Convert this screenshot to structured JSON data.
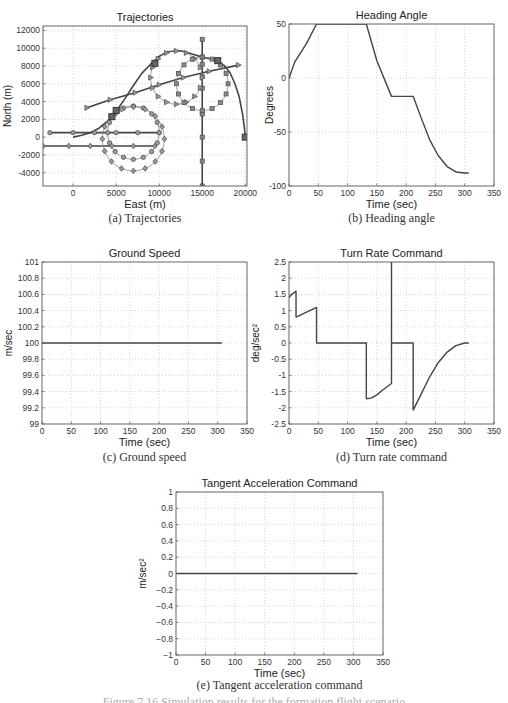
{
  "figure_caption": "Figure 7.16 Simulation results for the formation flight scenario",
  "chart_data": [
    {
      "id": "a",
      "type": "line",
      "title": "Trajectories",
      "xlabel": "East (m)",
      "ylabel": "North (m)",
      "caption": "(a) Trajectories",
      "xlim": [
        -3500,
        20200
      ],
      "ylim": [
        -5500,
        12500
      ],
      "xticks": [
        0,
        5000,
        10000,
        15000,
        20000
      ],
      "yticks": [
        -4000,
        -2000,
        0,
        2000,
        4000,
        6000,
        8000,
        10000,
        12000
      ],
      "grid": true,
      "box": {
        "x": 43,
        "y": 26,
        "w": 204,
        "h": 160
      },
      "series": [
        {
          "name": "vehicle-path",
          "marker": "none",
          "width": 1.6,
          "x": [
            0,
            1000,
            2000,
            3000,
            4000,
            4500,
            5000,
            6000,
            7000,
            8000,
            9000,
            9500,
            10000,
            11000,
            12000,
            12500,
            13000,
            14000,
            15000,
            16000,
            16800,
            17500,
            18200,
            18800,
            19300,
            19700,
            19900,
            20000
          ],
          "y": [
            0,
            200,
            500,
            1000,
            1800,
            2300,
            2900,
            4300,
            5800,
            7200,
            8200,
            8600,
            9100,
            9600,
            9700,
            9700,
            9600,
            9300,
            9000,
            8800,
            8500,
            8100,
            7300,
            6000,
            4500,
            2500,
            1000,
            0
          ]
        },
        {
          "name": "line-circle-diamond",
          "marker": "circle",
          "x": [
            -2700,
            0,
            2500,
            5000,
            7500,
            10000
          ],
          "y": [
            500,
            500,
            500,
            500,
            500,
            500
          ]
        },
        {
          "name": "line-diamond",
          "marker": "diamond",
          "x": [
            -3500,
            -500,
            2000,
            4500,
            7000,
            9500
          ],
          "y": [
            -1000,
            -1000,
            -1000,
            -1000,
            -1000,
            -1000
          ]
        },
        {
          "name": "line-triangle",
          "marker": "triangle",
          "x": [
            1600,
            4300,
            7200,
            10000,
            12800,
            15800,
            19200
          ],
          "y": [
            3300,
            4200,
            5000,
            5900,
            6700,
            7400,
            8100
          ]
        },
        {
          "name": "line-square-vertical",
          "marker": "square",
          "x": [
            15000,
            15000,
            15000,
            15000,
            15000,
            15000,
            15000,
            15000,
            15000,
            15000
          ],
          "y": [
            11000,
            8200,
            5500,
            2800,
            0,
            -2700,
            -5500,
            9000,
            6800,
            2600
          ]
        },
        {
          "name": "circle-orbit-1",
          "marker": "circle",
          "circle": {
            "cx": 7000,
            "cy": 500,
            "r": 3000,
            "n": 16
          }
        },
        {
          "name": "circle-orbit-2",
          "marker": "diamond",
          "circle": {
            "cx": 7000,
            "cy": -200,
            "r": 3600,
            "n": 16
          }
        },
        {
          "name": "circle-orbit-3",
          "marker": "triangle",
          "circle": {
            "cx": 12000,
            "cy": 6700,
            "r": 3000,
            "n": 16
          }
        },
        {
          "name": "circle-orbit-4",
          "marker": "square",
          "circle": {
            "cx": 15000,
            "cy": 6000,
            "r": 3000,
            "n": 16
          }
        },
        {
          "name": "waypoints-large",
          "marker": "bigsquare",
          "x": [
            4500,
            5000,
            9500,
            16800,
            20000
          ],
          "y": [
            2300,
            3000,
            8300,
            8600,
            0
          ]
        }
      ]
    },
    {
      "id": "b",
      "type": "line",
      "title": "Heading Angle",
      "xlabel": "Time (sec)",
      "ylabel": "Degrees",
      "caption": "(b) Heading angle",
      "xlim": [
        0,
        350
      ],
      "ylim": [
        -100,
        50
      ],
      "xticks": [
        0,
        50,
        100,
        150,
        200,
        250,
        300,
        350
      ],
      "yticks": [
        -100,
        -50,
        0,
        50
      ],
      "grid": true,
      "box": {
        "x": 289,
        "y": 24,
        "w": 205,
        "h": 162
      },
      "series": [
        {
          "name": "heading",
          "marker": "none",
          "width": 1.4,
          "x": [
            0,
            10,
            30,
            47,
            60,
            100,
            132,
            150,
            175,
            200,
            212,
            225,
            240,
            255,
            270,
            285,
            300,
            307
          ],
          "y": [
            0,
            15,
            32,
            50,
            50,
            50,
            50,
            16,
            -17,
            -17,
            -17,
            -36,
            -57,
            -72,
            -82,
            -87,
            -88,
            -88
          ]
        }
      ]
    },
    {
      "id": "c",
      "type": "line",
      "title": "Ground Speed",
      "xlabel": "Time (sec)",
      "ylabel": "m/sec",
      "caption": "(c) Ground speed",
      "xlim": [
        0,
        350
      ],
      "ylim": [
        99,
        101
      ],
      "xticks": [
        0,
        50,
        100,
        150,
        200,
        250,
        300,
        350
      ],
      "yticks": [
        99,
        99.2,
        99.4,
        99.6,
        99.8,
        100,
        100.2,
        100.4,
        100.6,
        100.8,
        101
      ],
      "grid": true,
      "box": {
        "x": 42,
        "y": 262,
        "w": 205,
        "h": 162
      },
      "series": [
        {
          "name": "speed",
          "marker": "none",
          "width": 1.4,
          "x": [
            0,
            307
          ],
          "y": [
            100,
            100
          ]
        }
      ]
    },
    {
      "id": "d",
      "type": "line",
      "title": "Turn Rate Command",
      "xlabel": "Time (sec)",
      "ylabel": "deg/sec²",
      "caption": "(d) Turn rate command",
      "xlim": [
        0,
        350
      ],
      "ylim": [
        -2.5,
        2.5
      ],
      "xticks": [
        0,
        50,
        100,
        150,
        200,
        250,
        300,
        350
      ],
      "yticks": [
        -2.5,
        -2,
        -1.5,
        -1,
        -0.5,
        0,
        0.5,
        1,
        1.5,
        2,
        2.5
      ],
      "grid": true,
      "box": {
        "x": 289,
        "y": 262,
        "w": 205,
        "h": 162
      },
      "series": [
        {
          "name": "turn-rate",
          "marker": "none",
          "width": 1.4,
          "x": [
            0,
            5,
            12,
            12,
            47,
            47,
            132,
            132,
            140,
            150,
            160,
            175,
            175,
            175,
            175,
            212,
            212,
            225,
            240,
            255,
            270,
            285,
            300,
            307
          ],
          "y": [
            1.4,
            1.5,
            1.6,
            0.8,
            1.1,
            0,
            0,
            -1.72,
            -1.7,
            -1.6,
            -1.45,
            -1.25,
            2.5,
            2.5,
            0,
            0,
            -2.07,
            -1.6,
            -1.05,
            -0.6,
            -0.28,
            -0.08,
            0,
            0
          ]
        }
      ]
    },
    {
      "id": "e",
      "type": "line",
      "title": "Tangent Acceleration Command",
      "xlabel": "Time (sec)",
      "ylabel": "m/sec²",
      "caption": "(e) Tangent acceleration command",
      "xlim": [
        0,
        350
      ],
      "ylim": [
        -1,
        1
      ],
      "xticks": [
        0,
        50,
        100,
        150,
        200,
        250,
        300,
        350
      ],
      "yticks": [
        -1,
        -0.8,
        -0.6,
        -0.4,
        -0.2,
        0,
        0.2,
        0.4,
        0.6,
        0.8,
        1
      ],
      "ytick_labels": [
        "−1",
        "−0.8",
        "−0.6",
        "−0.4",
        "−0.2",
        "0",
        "0.2",
        "0.4",
        "0.6",
        "0.8",
        "1"
      ],
      "grid": true,
      "box": {
        "x": 176,
        "y": 492,
        "w": 207,
        "h": 163
      },
      "series": [
        {
          "name": "tangent-accel",
          "marker": "none",
          "width": 1.4,
          "x": [
            0,
            307
          ],
          "y": [
            0,
            0
          ]
        }
      ]
    }
  ]
}
